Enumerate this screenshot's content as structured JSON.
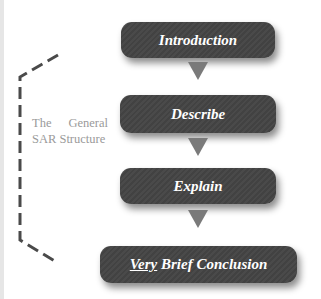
{
  "diagram": {
    "label_line1": "The General",
    "label_line2": "SAR Structure",
    "steps": [
      {
        "label": "Introduction"
      },
      {
        "label": "Describe"
      },
      {
        "label": "Explain"
      },
      {
        "label_emphasis": "Very",
        "label_rest": " Brief Conclusion"
      }
    ]
  },
  "colors": {
    "box": "#474747",
    "arrow": "#7a7a7a",
    "label": "#9a9a9a",
    "bracket": "#4a4a4a"
  }
}
